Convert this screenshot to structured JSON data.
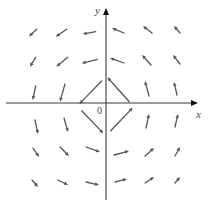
{
  "figure": {
    "x_axis_label": "x",
    "y_axis_label": "y",
    "origin_label": "0",
    "colors": {
      "axis": "#3a3a3a",
      "vector": "#555555",
      "background": "#ffffff"
    }
  },
  "axes": {
    "origin": [
      106,
      103
    ],
    "x_axis": {
      "from": [
        6,
        103
      ],
      "to": [
        198,
        103
      ]
    },
    "y_axis": {
      "from": [
        106,
        200
      ],
      "to": [
        106,
        8
      ]
    }
  },
  "vectors": [
    {
      "tail": [
        36.7,
        29.3
      ],
      "head": [
        29,
        36.5
      ]
    },
    {
      "tail": [
        66.7,
        29.3
      ],
      "head": [
        55.7,
        36.7
      ]
    },
    {
      "tail": [
        95.7,
        31.7
      ],
      "head": [
        82.7,
        34
      ]
    },
    {
      "tail": [
        35.7,
        57.3
      ],
      "head": [
        30,
        66.7
      ]
    },
    {
      "tail": [
        67.7,
        57.3
      ],
      "head": [
        56.3,
        66.7
      ]
    },
    {
      "tail": [
        97.3,
        59.3
      ],
      "head": [
        81.7,
        63.3
      ]
    },
    {
      "tail": [
        35.7,
        86
      ],
      "head": [
        32.7,
        100
      ]
    },
    {
      "tail": [
        65,
        84
      ],
      "head": [
        60,
        101.5
      ]
    },
    {
      "tail": [
        101.7,
        81
      ],
      "head": [
        79.3,
        104
      ]
    },
    {
      "tail": [
        124,
        33
      ],
      "head": [
        112,
        28
      ]
    },
    {
      "tail": [
        152,
        33
      ],
      "head": [
        143,
        26
      ]
    },
    {
      "tail": [
        180,
        33
      ],
      "head": [
        174,
        26
      ]
    },
    {
      "tail": [
        124,
        63
      ],
      "head": [
        110,
        58
      ]
    },
    {
      "tail": [
        151,
        65
      ],
      "head": [
        142,
        55
      ]
    },
    {
      "tail": [
        180,
        64
      ],
      "head": [
        173,
        55
      ]
    },
    {
      "tail": [
        129.3,
        101.7
      ],
      "head": [
        107.3,
        77.3
      ]
    },
    {
      "tail": [
        149,
        96
      ],
      "head": [
        145,
        81
      ]
    },
    {
      "tail": [
        177,
        95
      ],
      "head": [
        174,
        82
      ]
    },
    {
      "tail": [
        35,
        120
      ],
      "head": [
        38,
        134
      ]
    },
    {
      "tail": [
        64,
        118
      ],
      "head": [
        68,
        132
      ]
    },
    {
      "tail": [
        81.7,
        110.7
      ],
      "head": [
        103.3,
        133.3
      ]
    },
    {
      "tail": [
        33,
        148
      ],
      "head": [
        39,
        157
      ]
    },
    {
      "tail": [
        60,
        147
      ],
      "head": [
        69,
        156
      ]
    },
    {
      "tail": [
        86,
        147
      ],
      "head": [
        100,
        152
      ]
    },
    {
      "tail": [
        32,
        180
      ],
      "head": [
        38,
        187
      ]
    },
    {
      "tail": [
        58,
        180
      ],
      "head": [
        68,
        185
      ]
    },
    {
      "tail": [
        86,
        182
      ],
      "head": [
        99,
        185
      ]
    },
    {
      "tail": [
        110.7,
        130.7
      ],
      "head": [
        132.7,
        107.7
      ]
    },
    {
      "tail": [
        146,
        128
      ],
      "head": [
        149,
        114
      ]
    },
    {
      "tail": [
        175,
        127
      ],
      "head": [
        178,
        114
      ]
    },
    {
      "tail": [
        114,
        155
      ],
      "head": [
        129,
        151
      ]
    },
    {
      "tail": [
        145,
        156
      ],
      "head": [
        154,
        148
      ]
    },
    {
      "tail": [
        175,
        156
      ],
      "head": [
        180,
        147
      ]
    },
    {
      "tail": [
        115,
        182
      ],
      "head": [
        127,
        179
      ]
    },
    {
      "tail": [
        145,
        183
      ],
      "head": [
        154,
        177
      ]
    },
    {
      "tail": [
        175,
        183
      ],
      "head": [
        180,
        177
      ]
    }
  ]
}
